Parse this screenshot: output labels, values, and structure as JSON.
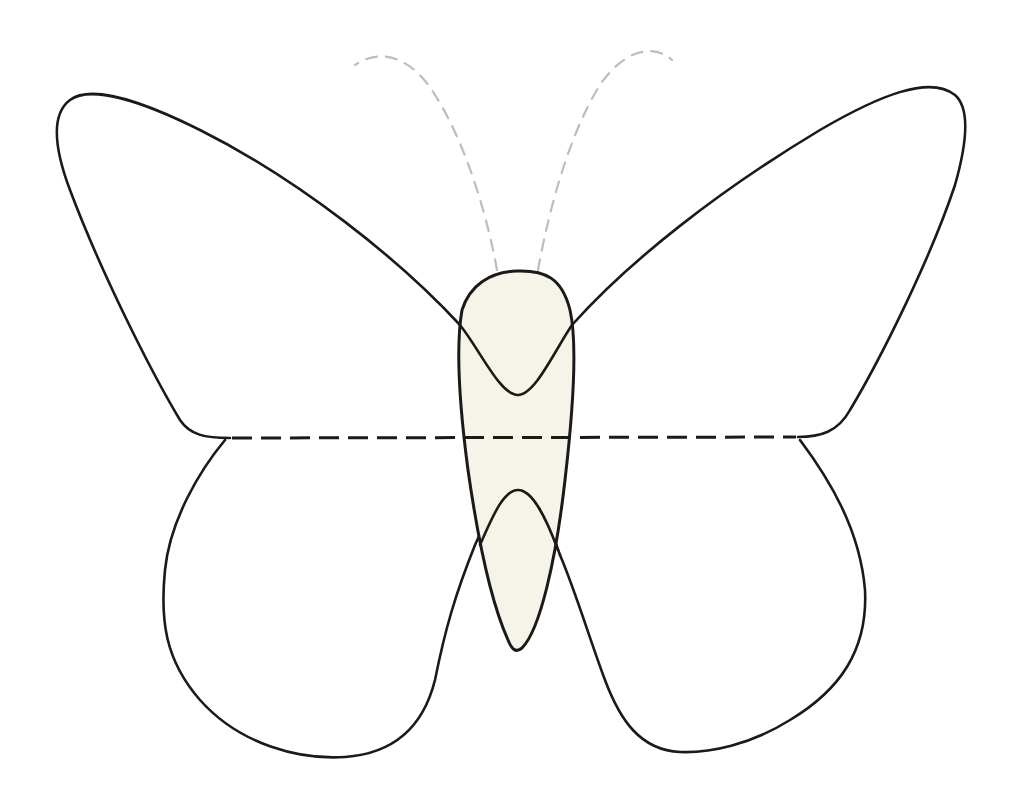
{
  "diagram": {
    "colors": {
      "background": "#ffffff",
      "outline": "#1a1a1a",
      "body_fill": "#f6f3e8",
      "antenna": "#bdbdbd",
      "fold_line": "#1a1a1a"
    },
    "parts": [
      {
        "id": "left-forewing",
        "style": "solid outline"
      },
      {
        "id": "right-forewing",
        "style": "solid outline"
      },
      {
        "id": "left-hindwing",
        "style": "solid outline"
      },
      {
        "id": "right-hindwing",
        "style": "solid outline"
      },
      {
        "id": "body",
        "style": "solid outline, cream fill"
      },
      {
        "id": "left-antenna",
        "style": "light gray dashed"
      },
      {
        "id": "right-antenna",
        "style": "light gray dashed"
      },
      {
        "id": "fold-line",
        "style": "black dashed horizontal"
      }
    ],
    "labels": []
  }
}
